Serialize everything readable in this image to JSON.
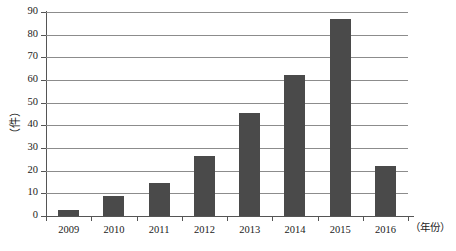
{
  "chart_data": {
    "type": "bar",
    "title": "",
    "subtitle": "",
    "xlabel": "（年份）",
    "ylabel": "（件）",
    "categories": [
      "2009",
      "2010",
      "2011",
      "2012",
      "2013",
      "2014",
      "2015",
      "2016"
    ],
    "values": [
      2.5,
      9,
      14.5,
      26.5,
      45.5,
      62,
      87,
      22
    ],
    "series": [
      {
        "name": "",
        "values": [
          2.5,
          9,
          14.5,
          26.5,
          45.5,
          62,
          87,
          22
        ]
      }
    ],
    "ylim": [
      0,
      90
    ],
    "ytick_values": [
      0,
      10,
      20,
      30,
      40,
      50,
      60,
      70,
      80,
      90
    ],
    "ytick_labels": [
      "0",
      "10",
      "20",
      "30",
      "40",
      "50",
      "60",
      "70",
      "80",
      "90"
    ],
    "grid": true,
    "grid_axis": "y",
    "legend": false,
    "legend_position": "none",
    "bar_color": "#4a4a4a",
    "gridline_color": "#8c8c8c",
    "axis_color": "#555555",
    "background_color": "#ffffff",
    "annotations": []
  }
}
